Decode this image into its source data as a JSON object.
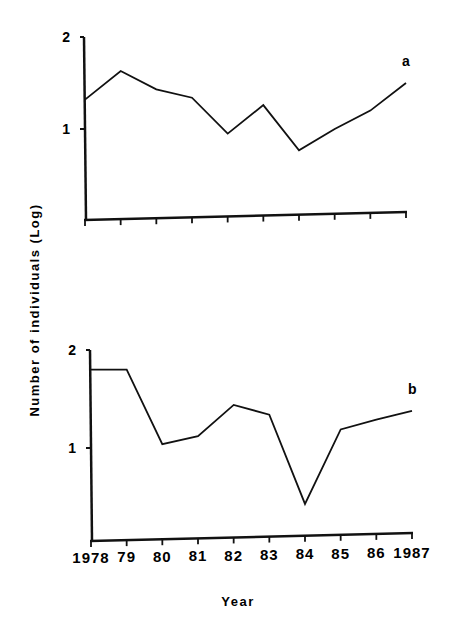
{
  "chart_data": [
    {
      "type": "line",
      "panel_label": "a",
      "x": [
        1978,
        1979,
        1980,
        1981,
        1982,
        1983,
        1984,
        1985,
        1986,
        1987
      ],
      "values": [
        1.32,
        1.63,
        1.43,
        1.34,
        0.95,
        1.26,
        0.77,
        1.0,
        1.2,
        1.5
      ],
      "yticks": [
        "1",
        "2"
      ],
      "ylim": [
        0,
        2
      ],
      "grid": false
    },
    {
      "type": "line",
      "panel_label": "b",
      "x": [
        1978,
        1979,
        1980,
        1981,
        1982,
        1983,
        1984,
        1985,
        1986,
        1987
      ],
      "values": [
        1.8,
        1.8,
        1.04,
        1.12,
        1.44,
        1.34,
        0.43,
        1.19,
        1.29,
        1.38
      ],
      "yticks": [
        "1",
        "2"
      ],
      "ylim": [
        0,
        2
      ],
      "grid": false
    }
  ],
  "shared": {
    "ylabel": "Number of individuals (Log)",
    "xlabel": "Year",
    "xtick_labels": [
      "1978",
      "79",
      "80",
      "81",
      "82",
      "83",
      "84",
      "85",
      "86",
      "1987"
    ]
  }
}
